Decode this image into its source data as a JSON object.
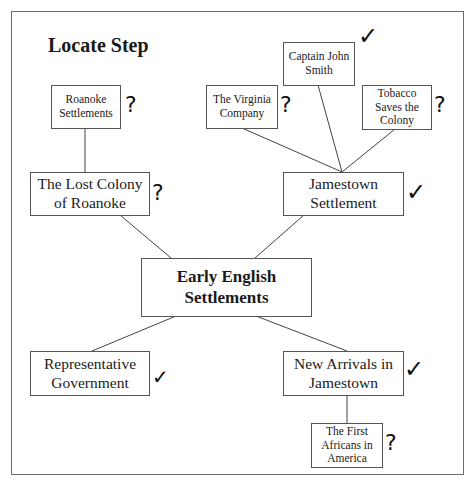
{
  "title": "Locate Step",
  "center": {
    "label": "Early English Settlements"
  },
  "nodes": {
    "roanoke_settlements": {
      "label": "Roanoke Settlements",
      "mark": "?"
    },
    "lost_colony": {
      "label": "The Lost Colony of Roanoke",
      "mark": "?"
    },
    "virginia_company": {
      "label": "The Virginia Company",
      "mark": "?"
    },
    "john_smith": {
      "label": "Captain John Smith",
      "mark": "✓"
    },
    "tobacco": {
      "label": "Tobacco Saves the Colony",
      "mark": "?"
    },
    "jamestown": {
      "label": "Jamestown Settlement",
      "mark": "✓"
    },
    "rep_gov": {
      "label": "Representative Government",
      "mark": "✓"
    },
    "new_arrivals": {
      "label": "New Arrivals in Jamestown",
      "mark": "✓"
    },
    "first_africans": {
      "label": "The First Africans in America",
      "mark": "?"
    }
  }
}
